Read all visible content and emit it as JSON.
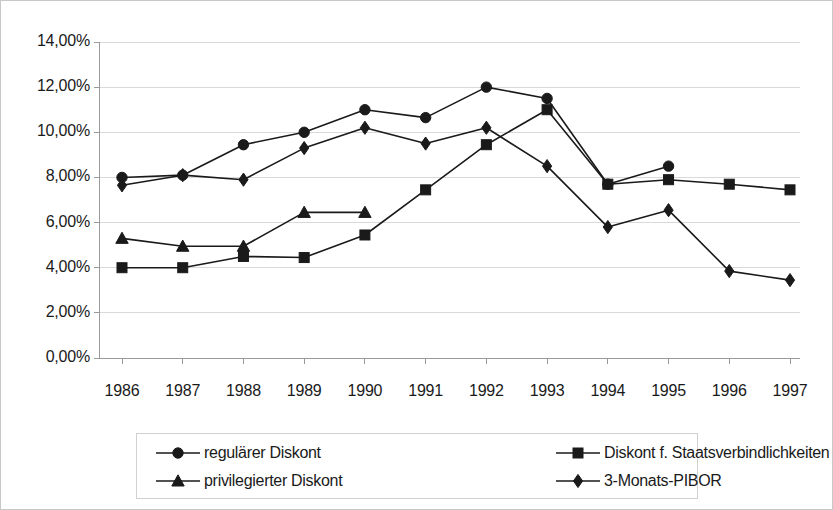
{
  "chart_data": {
    "type": "line",
    "title": "",
    "xlabel": "",
    "ylabel": "",
    "categories": [
      "1986",
      "1987",
      "1988",
      "1989",
      "1990",
      "1991",
      "1992",
      "1993",
      "1994",
      "1995",
      "1996",
      "1997"
    ],
    "x_tick_labels": [
      "1986",
      "1987",
      "1988",
      "1989",
      "1990",
      "1991",
      "1992",
      "1993",
      "1994",
      "1995",
      "1996",
      "1997"
    ],
    "y_tick_labels": [
      "0,00%",
      "2,00%",
      "4,00%",
      "6,00%",
      "8,00%",
      "10,00%",
      "12,00%",
      "14,00%"
    ],
    "y_tick_values": [
      0,
      2,
      4,
      6,
      8,
      10,
      12,
      14
    ],
    "ylim": [
      0,
      14
    ],
    "y_unit": "%",
    "grid": true,
    "grid_axis": "y",
    "legend_position": "bottom",
    "series": [
      {
        "name": "regulärer Diskont",
        "marker": "circle",
        "color": "#1a1a1a",
        "values": [
          8.0,
          8.1,
          9.45,
          10.0,
          11.0,
          10.65,
          12.0,
          11.5,
          7.7,
          8.5,
          null,
          null
        ]
      },
      {
        "name": "Diskont f. Staatsverbindlichkeiten",
        "marker": "square",
        "color": "#1a1a1a",
        "values": [
          4.0,
          4.0,
          4.5,
          4.45,
          5.45,
          7.45,
          9.45,
          11.0,
          7.7,
          7.9,
          7.7,
          7.45
        ]
      },
      {
        "name": "privilegierter Diskont",
        "marker": "triangle",
        "color": "#1a1a1a",
        "values": [
          5.3,
          4.95,
          4.95,
          6.45,
          6.45,
          null,
          null,
          null,
          null,
          null,
          null,
          null
        ]
      },
      {
        "name": "3-Monats-PIBOR",
        "marker": "diamond",
        "color": "#1a1a1a",
        "values": [
          7.65,
          8.1,
          7.9,
          9.3,
          10.2,
          9.5,
          10.2,
          8.5,
          5.8,
          6.55,
          3.85,
          3.45
        ]
      }
    ]
  },
  "legend": {
    "entries": [
      {
        "label": "regulärer Diskont",
        "marker": "circle"
      },
      {
        "label": "Diskont f. Staatsverbindlichkeiten",
        "marker": "square"
      },
      {
        "label": "privilegierter Diskont",
        "marker": "triangle"
      },
      {
        "label": "3-Monats-PIBOR",
        "marker": "diamond"
      }
    ]
  },
  "style": {
    "plot_background": "#ffffff",
    "grid_color": "#d9d9d9",
    "axis_color": "#9a9a9a",
    "series_color": "#1a1a1a",
    "frame_color": "#c8c8c8"
  }
}
